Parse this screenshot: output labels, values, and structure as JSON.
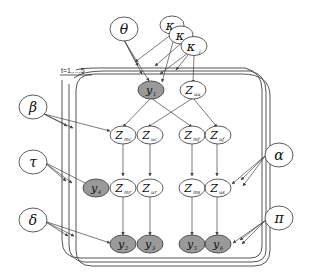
{
  "diagram": {
    "type": "probabilistic-graphical-model",
    "plate": {
      "label": "t=1,...,5"
    },
    "colors": {
      "observed_fill": "#9a9a9a",
      "latent_fill": "#ffffff",
      "stroke": "#333333",
      "edge": "#444444"
    },
    "hyperparameters": {
      "theta": {
        "symbol": "θ"
      },
      "kappa_back": {
        "symbol": "κ"
      },
      "kappa_mid": {
        "symbol": "κ"
      },
      "kappa_front": {
        "symbol": "κ",
        "sub": "j"
      },
      "beta": {
        "symbol": "β"
      },
      "tau": {
        "symbol": "τ"
      },
      "delta": {
        "symbol": "δ"
      },
      "alpha": {
        "symbol": "α"
      },
      "pi": {
        "symbol": "π"
      }
    },
    "nodes": {
      "y1": {
        "symbol": "y",
        "sub": "1",
        "observed": true
      },
      "zuu": {
        "symbol": "Z",
        "sub": "uu",
        "observed": false
      },
      "zmc": {
        "symbol": "Z",
        "sub": "mc",
        "observed": false
      },
      "zuc": {
        "symbol": "Z",
        "sub": "uc",
        "observed": false
      },
      "zmf": {
        "symbol": "Z",
        "sub": "mf",
        "observed": false
      },
      "zuf": {
        "symbol": "Z",
        "sub": "uf",
        "observed": false
      },
      "y4": {
        "symbol": "y",
        "sub": "4",
        "observed": true
      },
      "zmr": {
        "symbol": "Z",
        "sub": "mr",
        "observed": false
      },
      "zur": {
        "symbol": "Z",
        "sub": "ur",
        "observed": false
      },
      "zms": {
        "symbol": "Z",
        "sub": "ms",
        "observed": false
      },
      "zus": {
        "symbol": "Z",
        "sub": "us",
        "observed": false
      },
      "y2": {
        "symbol": "y",
        "sub": "2",
        "observed": true
      },
      "y3": {
        "symbol": "y",
        "sub": "3",
        "observed": true
      },
      "y5": {
        "symbol": "y",
        "sub": "5",
        "observed": true
      },
      "y6": {
        "symbol": "y",
        "sub": "6",
        "observed": true
      }
    },
    "edges": [
      [
        "theta",
        "y1"
      ],
      [
        "kappa_front",
        "zuu"
      ],
      [
        "kappa_back",
        "y1"
      ],
      [
        "kappa_mid",
        "y1"
      ],
      [
        "y1",
        "zmc"
      ],
      [
        "y1",
        "zmf"
      ],
      [
        "zuu",
        "zuc"
      ],
      [
        "zuu",
        "zuf"
      ],
      [
        "beta",
        "zmc"
      ],
      [
        "zmc",
        "zmr"
      ],
      [
        "zuc",
        "zur"
      ],
      [
        "zmf",
        "zms"
      ],
      [
        "zuf",
        "zus"
      ],
      [
        "tau",
        "y4"
      ],
      [
        "alpha",
        "zus"
      ],
      [
        "zmr",
        "y2"
      ],
      [
        "zur",
        "y3"
      ],
      [
        "zms",
        "y5"
      ],
      [
        "zus",
        "y6"
      ],
      [
        "delta",
        "y2"
      ],
      [
        "pi",
        "y6"
      ]
    ]
  }
}
